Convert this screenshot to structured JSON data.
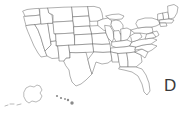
{
  "figure": {
    "kind": "outline-map",
    "background_color": "#ffffff",
    "line_color": "#6f6f6f",
    "width_px": 184,
    "height_px": 113
  },
  "overlay": {
    "text": "D",
    "note_clipped": "text is cut off at the right edge of the image",
    "color": "#3a3a3a"
  },
  "insets": {
    "alaska_label": "Alaska inset",
    "hawaii_label": "Hawaii inset"
  },
  "regions": {
    "contiguous_label": "Contiguous United States",
    "state_count": "49 outlined boundaries"
  }
}
